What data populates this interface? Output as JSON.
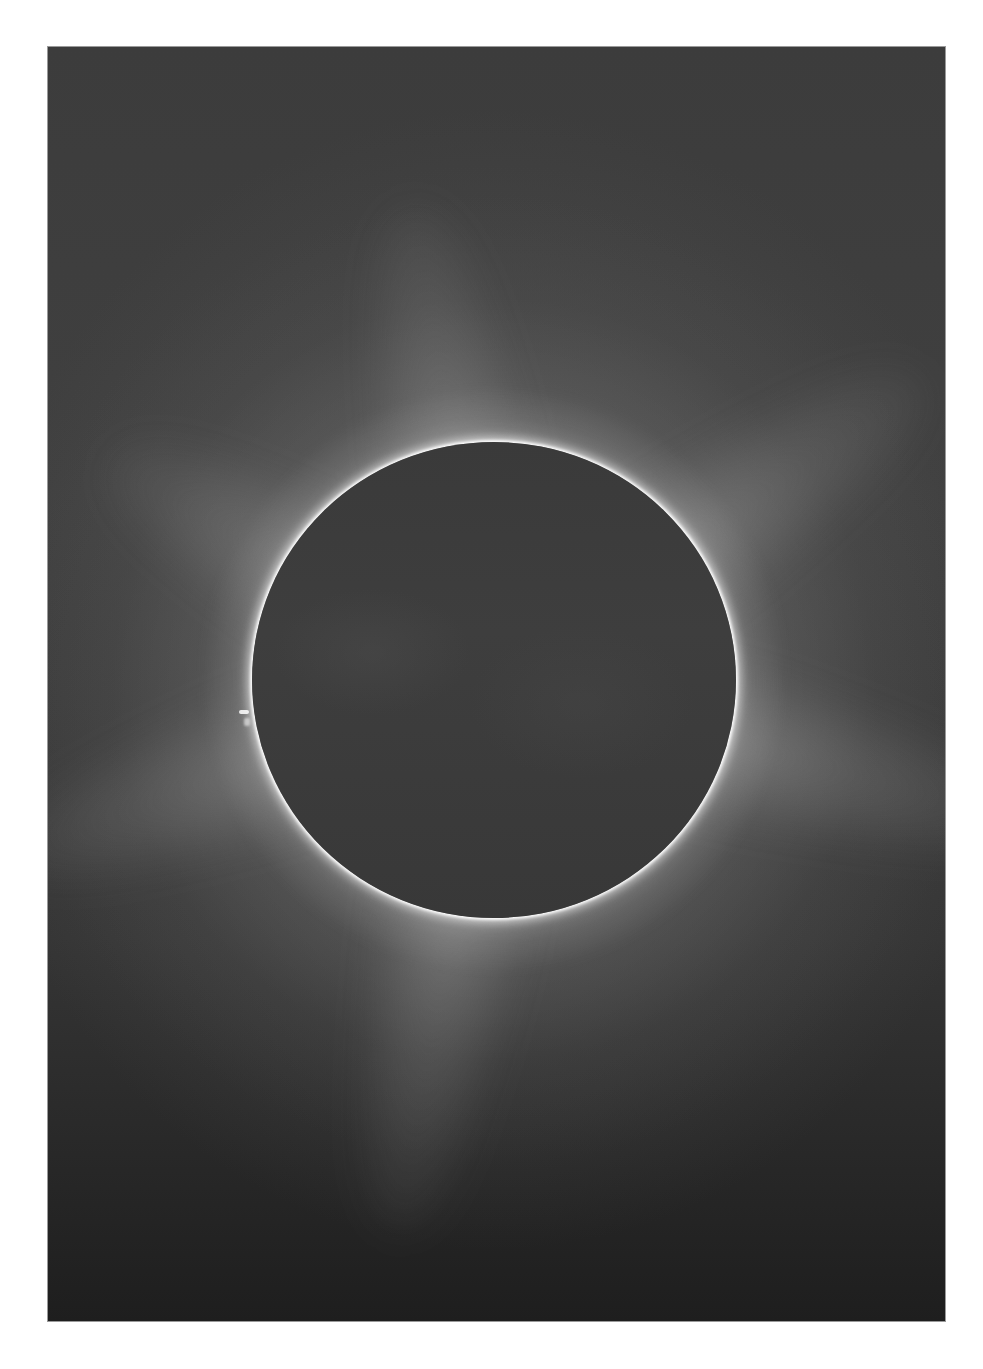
{
  "image": {
    "subject": "total solar eclipse",
    "description": "Black-and-white photograph of a total solar eclipse: dark lunar disk surrounded by a bright white solar corona with streamers, small prominence on the left limb, set on a dark gray sky with a white page border.",
    "colors": {
      "page_background": "#ffffff",
      "sky": "#3c3c3c",
      "sky_bottom": "#1e1e1e",
      "moon_disk": "#3c3c3c",
      "corona": "#ffffff"
    },
    "moon": {
      "center_x": 494,
      "center_y": 680,
      "radius": 242
    }
  }
}
